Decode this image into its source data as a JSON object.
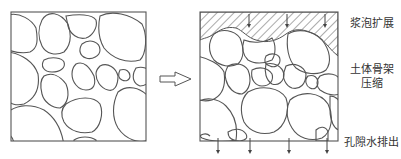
{
  "figure": {
    "stroke_color": "#555555",
    "background": "#ffffff",
    "panels": [
      {
        "name": "before",
        "label": ""
      },
      {
        "name": "after",
        "label": ""
      }
    ],
    "arrow_between": "hollow-right-arrow"
  },
  "labels": {
    "top": "浆泡扩展",
    "middle_line1": "土体骨架",
    "middle_line2": "压缩",
    "bottom": "孔隙水排出"
  }
}
